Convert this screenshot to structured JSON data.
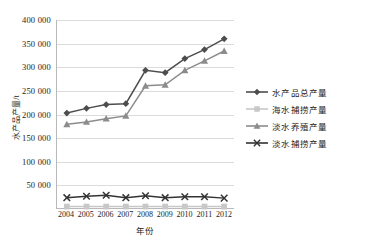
{
  "chart_data": {
    "type": "line",
    "title": "",
    "xlabel": "年份",
    "ylabel": "水产品产量/t",
    "categories": [
      "2004",
      "2005",
      "2006",
      "2007",
      "2008",
      "2009",
      "2010",
      "2011",
      "2012"
    ],
    "ylim": [
      0,
      400000
    ],
    "ytick_labels": [
      "0",
      "50 000",
      "100 000",
      "150 000",
      "200 000",
      "250 000",
      "300 000",
      "350 000",
      "400 000"
    ],
    "ytick_values": [
      0,
      50000,
      100000,
      150000,
      200000,
      250000,
      300000,
      350000,
      400000
    ],
    "grid": true,
    "legend_position": "right",
    "series": [
      {
        "name": "水产品总产量",
        "marker": "diamond",
        "color": "#4d4d4d",
        "values": [
          202000,
          212000,
          220000,
          222000,
          293000,
          288000,
          318000,
          337000,
          360000
        ]
      },
      {
        "name": "海水捕捞产量",
        "marker": "square",
        "color": "#c8c8c8",
        "values": [
          3000,
          3000,
          3000,
          3000,
          3000,
          3000,
          3000,
          3000,
          3000
        ]
      },
      {
        "name": "淡水养殖产量",
        "marker": "triangle",
        "color": "#8c8c8c",
        "values": [
          178000,
          183000,
          190000,
          196000,
          260000,
          262000,
          293000,
          313000,
          334000
        ]
      },
      {
        "name": "淡水捕捞产量",
        "marker": "cross",
        "color": "#333333",
        "values": [
          22000,
          25000,
          27000,
          22000,
          26000,
          22000,
          24000,
          24000,
          21000
        ]
      }
    ]
  }
}
